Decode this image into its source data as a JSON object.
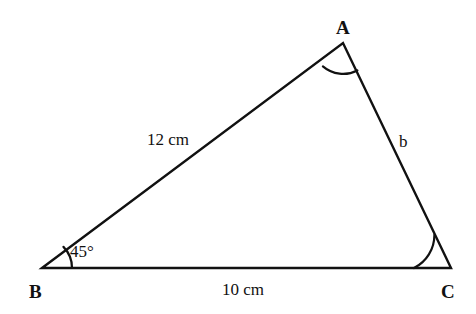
{
  "figure": {
    "type": "triangle-diagram",
    "background_color": "#ffffff",
    "stroke_color": "#111111",
    "text_color": "#111111",
    "stroke_width": 2.4
  },
  "vertices": [
    {
      "name": "A",
      "label": "A",
      "x": 343,
      "y": 43,
      "label_x": 336,
      "label_y": 18
    },
    {
      "name": "B",
      "label": "B",
      "x": 42,
      "y": 268,
      "label_x": 29,
      "label_y": 282
    },
    {
      "name": "C",
      "label": "C",
      "x": 451,
      "y": 268,
      "label_x": 441,
      "label_y": 282
    }
  ],
  "sides": [
    {
      "name": "AB",
      "label": "12 cm",
      "label_x": 147,
      "label_y": 131
    },
    {
      "name": "BC",
      "label": "10 cm",
      "label_x": 222,
      "label_y": 281
    },
    {
      "name": "AC",
      "label": "b",
      "label_x": 399,
      "label_y": 133
    }
  ],
  "angles": [
    {
      "vertex": "B",
      "label": "45°",
      "label_x": 70,
      "label_y": 243,
      "arc_radius": 30,
      "has_label": true
    },
    {
      "vertex": "A",
      "label": "",
      "arc_radius": 31,
      "has_label": false
    },
    {
      "vertex": "C",
      "label": "",
      "arc_radius": 37,
      "has_label": false
    }
  ],
  "geometry": {
    "triangle_path": "M 42 268 L 343 43 L 451 268 Z",
    "arc_at_B": "M 72 268 A 30 30 0 0 0 63.47 246.87",
    "arc_at_A": "M 322.90 66.44 A 31 31 0 0 0 357.39 70.43",
    "arc_at_C": "M 414 268 A 37 37 0 0 0 434.42 234.92"
  }
}
